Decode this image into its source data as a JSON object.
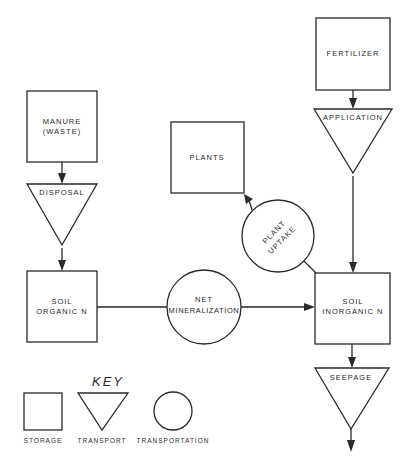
{
  "diagram": {
    "nodes": {
      "fertilizer": {
        "type": "storage",
        "label": "FERTILIZER"
      },
      "application": {
        "type": "transport",
        "label": "APPLICATION"
      },
      "manure": {
        "type": "storage",
        "label_line1": "MANURE",
        "label_line2": "(WASTE)"
      },
      "disposal": {
        "type": "transport",
        "label": "DISPOSAL"
      },
      "plants": {
        "type": "storage",
        "label": "PLANTS"
      },
      "plant_uptake": {
        "type": "transformation",
        "label_line1": "PLANT",
        "label_line2": "UPTAKE"
      },
      "soil_organic_n": {
        "type": "storage",
        "label_line1": "SOIL",
        "label_line2": "ORGANIC N"
      },
      "net_mineralization": {
        "type": "transformation",
        "label_line1": "NET",
        "label_line2": "MINERALIZATION"
      },
      "soil_inorganic_n": {
        "type": "storage",
        "label_line1": "SOIL",
        "label_line2": "INORGANIC N"
      },
      "seepage": {
        "type": "transport",
        "label": "SEEPAGE"
      }
    },
    "edges": [
      {
        "from": "fertilizer",
        "to": "application"
      },
      {
        "from": "application",
        "to": "soil_inorganic_n"
      },
      {
        "from": "manure",
        "to": "disposal"
      },
      {
        "from": "disposal",
        "to": "soil_organic_n"
      },
      {
        "from": "soil_organic_n",
        "to": "net_mineralization"
      },
      {
        "from": "net_mineralization",
        "to": "soil_inorganic_n"
      },
      {
        "from": "soil_inorganic_n",
        "to": "plant_uptake"
      },
      {
        "from": "plant_uptake",
        "to": "plants"
      },
      {
        "from": "soil_inorganic_n",
        "to": "seepage"
      },
      {
        "from": "seepage",
        "to": "out"
      }
    ]
  },
  "key": {
    "title": "KEY",
    "storage_label": "STORAGE",
    "transport_label": "TRANSPORT",
    "transformation_label": "TRANSPORTATION"
  },
  "colors": {
    "ink": "#2a2a2a",
    "background": "#ffffff"
  }
}
